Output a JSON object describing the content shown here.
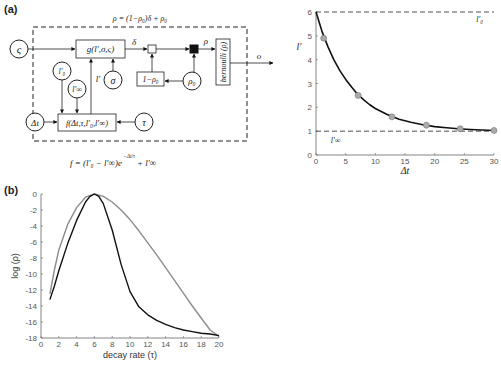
{
  "panel_a": {
    "label": "(a)",
    "diagram": {
      "top_equation": "ρ = (1−ρ₀)δ + ρ₀",
      "bottom_equation_main": "f = (l′₀ − l′∞)e",
      "bottom_equation_exp": "−Δt/τ",
      "bottom_equation_tail": "+ l′∞",
      "nodes": {
        "zeta": "ς",
        "l0": "l′₀",
        "linf": "l′∞",
        "dt": "Δt",
        "sigma": "σ",
        "tau": "τ",
        "rho0": "ρ₀"
      },
      "boxes": {
        "g": "g(l′,σ,ς)",
        "f": "f(Δt,τ,l′₀,l′∞)",
        "one_minus_rho0": "1−ρ₀",
        "bernoulli": "bernoulli (ρ)"
      },
      "edge_labels": {
        "delta": "δ",
        "rho": "ρ",
        "lprime": "l′",
        "output": "o"
      }
    }
  },
  "panel_b": {
    "label": "(b)"
  },
  "chart_data": [
    {
      "type": "line",
      "title": "",
      "xlabel": "Δt",
      "ylabel": "l′",
      "xlim": [
        0,
        30
      ],
      "ylim": [
        0,
        6
      ],
      "x_ticks": [
        "0",
        "5",
        "10",
        "15",
        "20",
        "25",
        "30"
      ],
      "y_ticks": [
        "0",
        "1",
        "2",
        "3",
        "4",
        "5",
        "6"
      ],
      "grid": false,
      "annotations": [
        {
          "text": "l′₀",
          "x": 27,
          "y": 5.6
        },
        {
          "text": "l′∞",
          "x": 2.5,
          "y": 0.5
        }
      ],
      "reference_lines": [
        {
          "name": "l′₀",
          "y": 6,
          "style": "dashed"
        },
        {
          "name": "l′∞",
          "y": 1,
          "style": "dashed"
        }
      ],
      "series": [
        {
          "name": "curve",
          "style": "solid",
          "x": [
            0,
            1,
            2,
            3,
            4,
            5,
            6,
            7,
            8,
            9,
            10,
            12,
            14,
            16,
            18,
            20,
            22,
            24,
            26,
            28,
            30
          ],
          "y": [
            6.0,
            5.2,
            4.55,
            4.0,
            3.55,
            3.17,
            2.85,
            2.55,
            2.32,
            2.12,
            1.95,
            1.7,
            1.5,
            1.37,
            1.27,
            1.19,
            1.14,
            1.1,
            1.07,
            1.05,
            1.03
          ]
        },
        {
          "name": "samples",
          "style": "markers",
          "marker_color": "#aaaaaa",
          "x": [
            1.3,
            7.1,
            12.8,
            18.6,
            24.3,
            30
          ],
          "y": [
            4.9,
            2.5,
            1.6,
            1.25,
            1.1,
            1.03
          ]
        }
      ]
    },
    {
      "type": "line",
      "title": "",
      "xlabel": "decay rate (τ)",
      "ylabel": "log (ρ)",
      "xlim": [
        0,
        20
      ],
      "ylim": [
        -18,
        0
      ],
      "x_ticks": [
        "0",
        "2",
        "4",
        "6",
        "8",
        "10",
        "12",
        "14",
        "16",
        "18",
        "20"
      ],
      "y_ticks": [
        "0",
        "-2",
        "-4",
        "-6",
        "-8",
        "-10",
        "-12",
        "-14",
        "-16",
        "-18"
      ],
      "grid": false,
      "series": [
        {
          "name": "gray",
          "color": "#8c8c8c",
          "x": [
            1,
            1.5,
            2,
            3,
            4,
            5,
            6,
            7,
            8,
            9,
            10,
            11,
            12,
            13,
            14,
            15,
            16,
            17,
            18,
            19,
            20
          ],
          "y": [
            -12.5,
            -9.5,
            -7.0,
            -3.8,
            -1.7,
            -0.4,
            0,
            -0.3,
            -1.0,
            -2.0,
            -3.2,
            -4.6,
            -6.1,
            -7.6,
            -9.2,
            -10.8,
            -12.4,
            -14.0,
            -15.5,
            -17.0,
            -17.8
          ]
        },
        {
          "name": "black",
          "color": "#111111",
          "x": [
            1,
            1.5,
            2,
            3,
            4,
            5,
            5.5,
            6,
            6.5,
            7,
            8,
            9,
            10,
            11,
            12,
            13,
            14,
            15,
            16,
            17,
            18,
            19,
            20
          ],
          "y": [
            -13.2,
            -11.5,
            -9.6,
            -6.2,
            -3.3,
            -1.0,
            -0.3,
            0,
            -0.3,
            -1.2,
            -4.5,
            -8.8,
            -12.2,
            -14.1,
            -15.1,
            -15.8,
            -16.3,
            -16.7,
            -17.0,
            -17.2,
            -17.4,
            -17.5,
            -17.7
          ]
        }
      ]
    }
  ]
}
